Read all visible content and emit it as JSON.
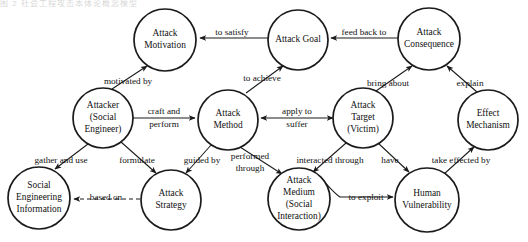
{
  "figure": {
    "title_fragment": "图 2 社会工程攻击本体论概念模型",
    "type": "concept-model-graph",
    "node_shape": "circle",
    "background_color": "#ffffff",
    "stroke_color": "#1a1a1a"
  },
  "nodes": [
    {
      "id": "attack-motivation",
      "label": "Attack\nMotivation",
      "cx": 165,
      "cy": 40,
      "r": 31
    },
    {
      "id": "attack-goal",
      "label": "Attack Goal",
      "cx": 298,
      "cy": 40,
      "r": 30
    },
    {
      "id": "attack-consequence",
      "label": "Attack\nConsequence",
      "cx": 429,
      "cy": 39,
      "r": 31
    },
    {
      "id": "attacker",
      "label": "Attacker\n(Social\nEngineer)",
      "cx": 103,
      "cy": 118,
      "r": 30
    },
    {
      "id": "attack-method",
      "label": "Attack\nMethod",
      "cx": 228,
      "cy": 120,
      "r": 30
    },
    {
      "id": "attack-target",
      "label": "Attack\nTarget\n(Victim)",
      "cx": 363,
      "cy": 118,
      "r": 30
    },
    {
      "id": "effect-mechanism",
      "label": "Effect\nMechanism",
      "cx": 488,
      "cy": 120,
      "r": 30
    },
    {
      "id": "social-eng-info",
      "label": "Social\nEngineering\nInformation",
      "cx": 39,
      "cy": 198,
      "r": 31
    },
    {
      "id": "attack-strategy",
      "label": "Attack\nStrategy",
      "cx": 171,
      "cy": 200,
      "r": 30
    },
    {
      "id": "attack-medium",
      "label": "Attack\nMedium\n(Social\nInteraction)",
      "cx": 299,
      "cy": 199,
      "r": 31
    },
    {
      "id": "human-vulnerability",
      "label": "Human\nVulnerability",
      "cx": 427,
      "cy": 200,
      "r": 32
    }
  ],
  "edges": [
    {
      "id": "e-goal-motivation",
      "label": "to satisfy",
      "from": "attack-goal",
      "to": "attack-motivation",
      "label_x": 232,
      "label_y": 33,
      "style": "solid"
    },
    {
      "id": "e-consequence-goal",
      "label": "feed back to",
      "from": "attack-consequence",
      "to": "attack-goal",
      "label_x": 364,
      "label_y": 33,
      "style": "solid"
    },
    {
      "id": "e-attacker-motivation",
      "label": "motivated by",
      "from": "attacker",
      "to": "attack-motivation",
      "label_x": 128,
      "label_y": 82,
      "style": "solid"
    },
    {
      "id": "e-method-goal",
      "label": "to achieve",
      "from": "attack-method",
      "to": "attack-goal",
      "label_x": 258,
      "label_y": 79,
      "style": "solid"
    },
    {
      "id": "e-target-consequence",
      "label": "bring about",
      "from": "attack-target",
      "to": "attack-consequence",
      "label_x": 388,
      "label_y": 84,
      "style": "solid"
    },
    {
      "id": "e-effect-consequence",
      "label": "explain",
      "from": "effect-mechanism",
      "to": "attack-consequence",
      "label_x": 470,
      "label_y": 84,
      "style": "solid"
    },
    {
      "id": "e-attacker-method",
      "label": "craft and\nperform",
      "from": "attacker",
      "to": "attack-method",
      "label_x": 166,
      "label_y": 118,
      "style": "solid"
    },
    {
      "id": "e-method-target",
      "label": "apply to\nsuffer",
      "from": "attack-target",
      "to": "attack-method",
      "label_x": 297,
      "label_y": 117,
      "style": "solid"
    },
    {
      "id": "e-attacker-info",
      "label": "gather and use",
      "from": "attacker",
      "to": "social-eng-info",
      "label_x": 62,
      "label_y": 161,
      "style": "solid"
    },
    {
      "id": "e-attacker-strategy",
      "label": "formulate",
      "from": "attacker",
      "to": "attack-strategy",
      "label_x": 136,
      "label_y": 161,
      "style": "solid"
    },
    {
      "id": "e-method-strategy",
      "label": "guided by",
      "from": "attack-method",
      "to": "attack-strategy",
      "label_x": 201,
      "label_y": 161,
      "style": "solid"
    },
    {
      "id": "e-strategy-info",
      "label": "based on",
      "from": "attack-strategy",
      "to": "social-eng-info",
      "label_x": 106,
      "label_y": 199,
      "style": "dashed"
    },
    {
      "id": "e-method-medium",
      "label": "performed\nthrough",
      "from": "attack-method",
      "to": "attack-medium",
      "label_x": 250,
      "label_y": 163,
      "style": "solid"
    },
    {
      "id": "e-target-medium",
      "label": "interacted through",
      "from": "attack-target",
      "to": "attack-medium",
      "label_x": 330,
      "label_y": 161,
      "style": "solid"
    },
    {
      "id": "e-target-vulnerability",
      "label": "have",
      "from": "attack-target",
      "to": "human-vulnerability",
      "label_x": 391,
      "label_y": 161,
      "style": "solid"
    },
    {
      "id": "e-medium-vulnerability",
      "label": "to exploit",
      "from": "attack-medium",
      "to": "human-vulnerability",
      "label_x": 366,
      "label_y": 198,
      "style": "solid"
    },
    {
      "id": "e-vulnerability-effect",
      "label": "take effected by",
      "from": "human-vulnerability",
      "to": "effect-mechanism",
      "label_x": 461,
      "label_y": 161,
      "style": "solid"
    }
  ]
}
